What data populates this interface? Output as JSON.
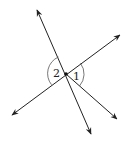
{
  "diagram": {
    "colors": {
      "stroke": "#222222",
      "arc": "#555555",
      "background": "#ffffff"
    },
    "center": {
      "x": 66,
      "y": 74
    },
    "angles": [
      {
        "label": "1",
        "side": "right"
      },
      {
        "label": "2",
        "side": "left"
      }
    ]
  }
}
